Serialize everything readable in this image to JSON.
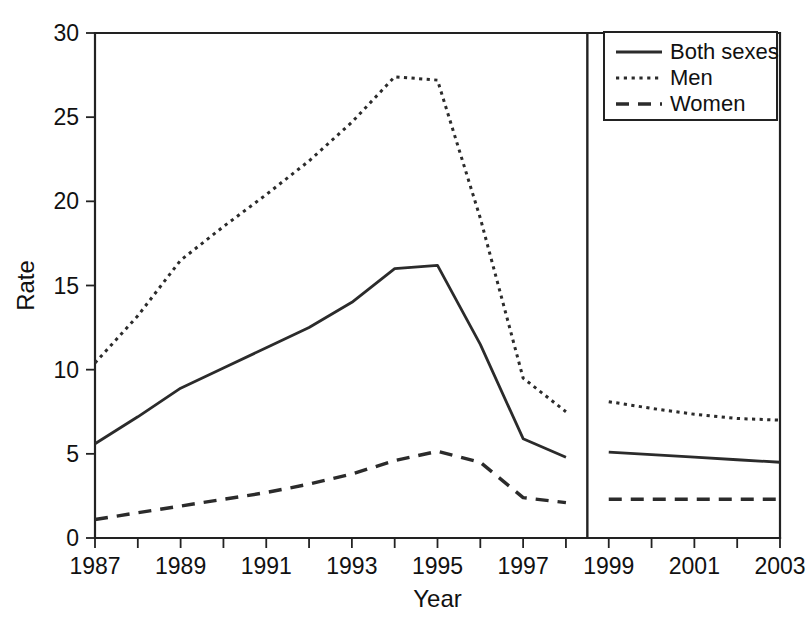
{
  "chart_data": {
    "type": "line",
    "title": "",
    "xlabel": "Year",
    "ylabel": "Rate",
    "xlim": [
      1987,
      2003
    ],
    "ylim": [
      0,
      30
    ],
    "grid": false,
    "legend_position": "top-right",
    "x_tick_labels": [
      "1987",
      "1989",
      "1991",
      "1993",
      "1995",
      "1997",
      "1999",
      "2001",
      "2003"
    ],
    "x_tick_values": [
      1987,
      1989,
      1991,
      1993,
      1995,
      1997,
      1999,
      2001,
      2003
    ],
    "x_minor_tick_values": [
      1988,
      1990,
      1992,
      1994,
      1996,
      1998,
      2000,
      2002
    ],
    "y_tick_labels": [
      "0",
      "5",
      "10",
      "15",
      "20",
      "25",
      "30"
    ],
    "y_tick_values": [
      0,
      5,
      10,
      15,
      20,
      25,
      30
    ],
    "axis_break": {
      "at_x": 1998.5,
      "note": "vertical divider separating 1987-1998 segment from 1999-2003 segment"
    },
    "x": [
      1987,
      1988,
      1989,
      1990,
      1991,
      1992,
      1993,
      1994,
      1995,
      1996,
      1997,
      1998
    ],
    "x_right": [
      1999,
      2000,
      2001,
      2002,
      2003
    ],
    "series": [
      {
        "name": "Both sexes",
        "style": "solid",
        "values": [
          5.6,
          7.2,
          8.9,
          10.1,
          11.3,
          12.5,
          14.0,
          16.0,
          16.2,
          11.5,
          5.9,
          4.8
        ],
        "values_right": [
          5.1,
          4.95,
          4.8,
          4.65,
          4.5
        ]
      },
      {
        "name": "Men",
        "style": "dotted",
        "values": [
          10.4,
          13.2,
          16.5,
          18.5,
          20.4,
          22.4,
          24.7,
          27.4,
          27.2,
          19.0,
          9.5,
          7.5
        ],
        "values_right": [
          8.1,
          7.7,
          7.35,
          7.1,
          7.0
        ]
      },
      {
        "name": "Women",
        "style": "dashed",
        "values": [
          1.1,
          1.5,
          1.9,
          2.3,
          2.7,
          3.2,
          3.8,
          4.6,
          5.15,
          4.5,
          2.4,
          2.1
        ],
        "values_right": [
          2.3,
          2.3,
          2.3,
          2.3,
          2.3
        ]
      }
    ]
  },
  "legend": {
    "entries": [
      {
        "label": "Both sexes",
        "style": "solid"
      },
      {
        "label": "Men",
        "style": "dotted"
      },
      {
        "label": "Women",
        "style": "dashed"
      }
    ]
  },
  "colors": {
    "ink": "#222222",
    "background": "#ffffff",
    "series": "#2b2b2b"
  }
}
